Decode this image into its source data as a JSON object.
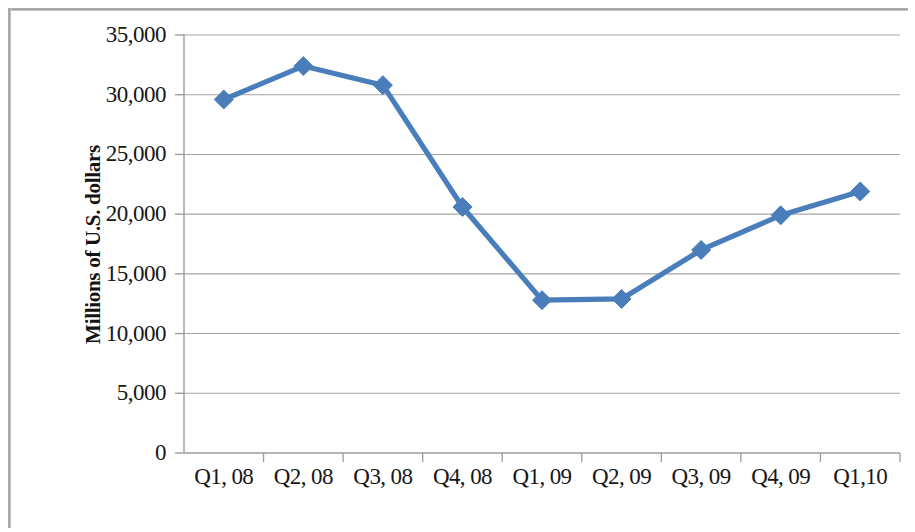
{
  "chart_data": {
    "type": "line",
    "title": "",
    "subtitle": "",
    "xlabel": "",
    "ylabel": "Millions of U.S. dollars",
    "categories": [
      "Q1, 08",
      "Q2, 08",
      "Q3, 08",
      "Q4, 08",
      "Q1, 09",
      "Q2, 09",
      "Q3, 09",
      "Q4, 09",
      "Q1,10"
    ],
    "values": [
      29600,
      32400,
      30800,
      20600,
      12800,
      12900,
      17000,
      19900,
      21900
    ],
    "series": [
      {
        "name": "",
        "values": [
          29600,
          32400,
          30800,
          20600,
          12800,
          12900,
          17000,
          19900,
          21900
        ]
      }
    ],
    "ylim": [
      0,
      35000
    ],
    "ytick_labels": [
      "0",
      "5,000",
      "10,000",
      "15,000",
      "20,000",
      "25,000",
      "30,000",
      "35,000"
    ],
    "ytick_values": [
      0,
      5000,
      10000,
      15000,
      20000,
      25000,
      30000,
      35000
    ],
    "grid": "horizontal",
    "legend": "none",
    "marker": "diamond",
    "line_color": "#4a7ebb",
    "marker_color": "#4a7ebb",
    "gridline_color": "#a6a6a6",
    "axis_color": "#9c9c9c",
    "text_color": "#171717",
    "background_color": "#ffffff"
  }
}
